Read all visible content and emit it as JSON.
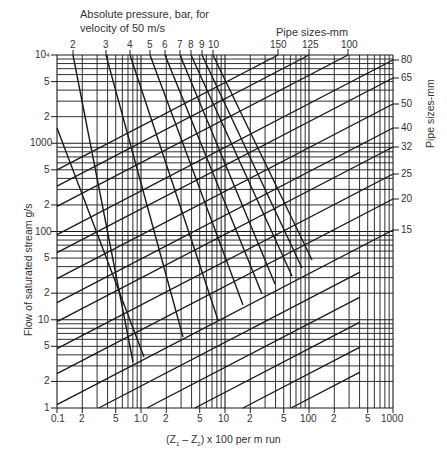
{
  "chart_data": {
    "type": "line",
    "xlabel": "(Z1 - Z2) x 100 per m run",
    "ylabel": "Flow of saturated stream g/s",
    "right_axis_label": "Pipe sizes-mm",
    "top_pipe_label": "Pipe sizes-mm",
    "xscale": "log",
    "yscale": "log",
    "xlim": [
      0.1,
      1000
    ],
    "ylim": [
      1,
      10000
    ],
    "grid": true,
    "x_tick_labels": [
      "0.1",
      "2",
      "5",
      "1.0",
      "2",
      "5",
      "10",
      "2",
      "5",
      "100",
      "2",
      "5",
      "1000"
    ],
    "y_tick_labels": [
      "10^4",
      "5",
      "2",
      "1000",
      "5",
      "2",
      "100",
      "5",
      "2",
      "10",
      "5",
      "2",
      "1"
    ],
    "pressure_lines_bar": [
      "2",
      "3",
      "4",
      "5",
      "6",
      "7",
      "8",
      "9",
      "10"
    ],
    "pipe_sizes_top_mm": [
      "150",
      "125",
      "100"
    ],
    "pipe_sizes_right_mm": [
      "80",
      "65",
      "50",
      "40",
      "32",
      "25",
      "20",
      "15"
    ],
    "series": [
      {
        "name": "Pipe 150 mm",
        "kind": "pipe",
        "right_value_flow_g_s": 10000
      },
      {
        "name": "Pipe 125 mm",
        "kind": "pipe",
        "right_value_flow_g_s": 10000
      },
      {
        "name": "Pipe 100 mm",
        "kind": "pipe",
        "right_value_flow_g_s": 10000
      },
      {
        "name": "Pipe 80 mm",
        "kind": "pipe",
        "right_value_flow_g_s": 8500
      },
      {
        "name": "Pipe 65 mm",
        "kind": "pipe",
        "right_value_flow_g_s": 5000
      },
      {
        "name": "Pipe 50 mm",
        "kind": "pipe",
        "right_value_flow_g_s": 2600
      },
      {
        "name": "Pipe 40 mm",
        "kind": "pipe",
        "right_value_flow_g_s": 1400
      },
      {
        "name": "Pipe 32 mm",
        "kind": "pipe",
        "right_value_flow_g_s": 850
      },
      {
        "name": "Pipe 25 mm",
        "kind": "pipe",
        "right_value_flow_g_s": 420
      },
      {
        "name": "Pipe 20 mm",
        "kind": "pipe",
        "right_value_flow_g_s": 220
      },
      {
        "name": "Pipe 15 mm",
        "kind": "pipe",
        "right_value_flow_g_s": 100
      },
      {
        "name": "2 bar",
        "kind": "pressure"
      },
      {
        "name": "3 bar",
        "kind": "pressure"
      },
      {
        "name": "4 bar",
        "kind": "pressure"
      },
      {
        "name": "5 bar",
        "kind": "pressure"
      },
      {
        "name": "6 bar",
        "kind": "pressure"
      },
      {
        "name": "7 bar",
        "kind": "pressure"
      },
      {
        "name": "8 bar",
        "kind": "pressure"
      },
      {
        "name": "9 bar",
        "kind": "pressure"
      },
      {
        "name": "10 bar",
        "kind": "pressure"
      }
    ]
  },
  "labels": {
    "title_line1": "Absolute pressure, bar, for",
    "title_line2": "velocity of 50 m/s",
    "pipe_top_title": "Pipe sizes-mm",
    "pipe_right_title": "Pipe sizes-mm",
    "xlabel_main": "(Z",
    "xlabel_sub1": "1",
    "xlabel_mid": " – Z",
    "xlabel_sub2": "2",
    "xlabel_end": ") x 100 per m run",
    "ylabel": "Flow of saturated stream g/s"
  },
  "ticks": {
    "x": [
      "0.1",
      "2",
      "5",
      "1.0",
      "2",
      "5",
      "10",
      "2",
      "5",
      "100",
      "2",
      "5",
      "1000"
    ],
    "y": [
      "10",
      "5",
      "2",
      "1000",
      "5",
      "2",
      "100",
      "5",
      "2",
      "10",
      "5",
      "2",
      "1"
    ],
    "y_top_exp": "4",
    "pressure": [
      "2",
      "3",
      "4",
      "5",
      "6",
      "7",
      "8",
      "9",
      "10"
    ],
    "pipe_top": [
      "150",
      "125",
      "100"
    ],
    "pipe_right": [
      "80",
      "65",
      "50",
      "40",
      "32",
      "25",
      "20",
      "15"
    ]
  },
  "colors": {
    "ink": "#1a1a1a",
    "grid": "#2a2a2a",
    "text": "#333333",
    "background": "#ffffff"
  }
}
